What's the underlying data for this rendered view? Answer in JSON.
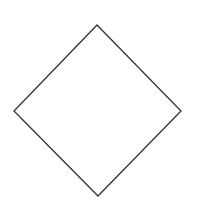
{
  "diagram": {
    "canvas": {
      "width": 205,
      "height": 216,
      "background": "#ffffff"
    },
    "shapes": [
      {
        "type": "diamond",
        "vertices": {
          "top": [
            97,
            25
          ],
          "right": [
            181,
            111
          ],
          "bottom": [
            98,
            196
          ],
          "left": [
            14,
            111
          ]
        },
        "stroke": "#333333",
        "stroke_width": 1.3,
        "fill": "none",
        "label": ""
      }
    ]
  }
}
